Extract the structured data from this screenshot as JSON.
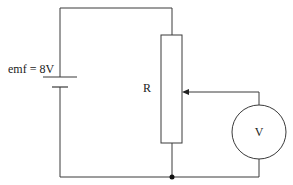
{
  "diagram": {
    "type": "circuit",
    "battery": {
      "label": "emf = 8V"
    },
    "resistor": {
      "label": "R",
      "kind": "potentiometer"
    },
    "voltmeter": {
      "label": "V"
    },
    "colors": {
      "line": "#3a3a3a",
      "background": "#ffffff"
    }
  }
}
